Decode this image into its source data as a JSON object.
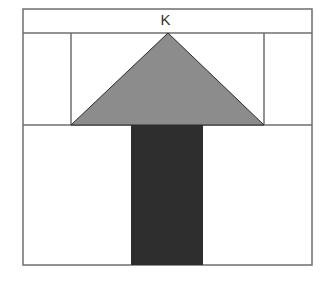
{
  "diagram": {
    "label": "K",
    "colors": {
      "outline": "#6e6e6e",
      "triangle_fill": "#8c8c8c",
      "triangle_stroke": "#2a2a2a",
      "rect_fill": "#2e2e2e",
      "background": "#ffffff"
    },
    "shapes": {
      "outer_frame": {
        "x": 23,
        "y": 9,
        "w": 289,
        "h": 256
      },
      "header_line_y": 33,
      "middle_line_y": 125,
      "inner_left_x": 71,
      "inner_right_x": 264,
      "triangle": {
        "apex": [
          168,
          33
        ],
        "base_left": [
          71,
          125
        ],
        "base_right": [
          264,
          125
        ]
      },
      "dark_rect": {
        "x": 131,
        "y": 125,
        "w": 72,
        "h": 140
      }
    }
  }
}
